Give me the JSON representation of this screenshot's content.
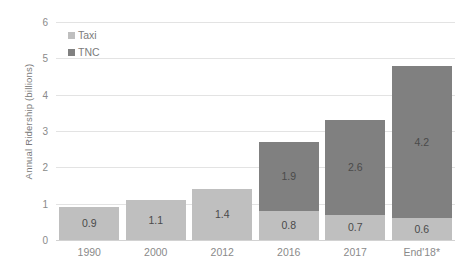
{
  "chart_data": {
    "type": "bar",
    "stacked": true,
    "title": "",
    "xlabel": "",
    "ylabel": "Annual Ridership  (billions)",
    "categories": [
      "1990",
      "2000",
      "2012",
      "2016",
      "2017",
      "End'18*"
    ],
    "series": [
      {
        "name": "Taxi",
        "color": "#bfbfbf",
        "values": [
          0.9,
          1.1,
          1.4,
          0.8,
          0.7,
          0.6
        ],
        "labels": [
          "0.9",
          "1.1",
          "1.4",
          "0.8",
          "0.7",
          "0.6"
        ]
      },
      {
        "name": "TNC",
        "color": "#808080",
        "values": [
          0,
          0,
          0,
          1.9,
          2.6,
          4.2
        ],
        "labels": [
          "",
          "",
          "",
          "1.9",
          "2.6",
          "4.2"
        ]
      }
    ],
    "ylim": [
      0,
      6
    ],
    "yticks": [
      "0",
      "1",
      "2",
      "3",
      "4",
      "5",
      "6"
    ],
    "grid": true,
    "legend_position": "top-left",
    "totals": [
      0.9,
      1.1,
      1.4,
      2.7,
      3.3,
      4.8
    ]
  },
  "colors": {
    "taxi": "#bfbfbf",
    "tnc": "#808080",
    "gridline": "#e3e3e3",
    "axis": "#d2d2d2",
    "tick_text": "#8a8a8a",
    "label_text": "#4a4a4a",
    "legend_text": "#7c7c7c"
  }
}
